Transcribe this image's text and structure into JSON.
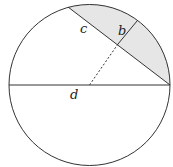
{
  "diagram": {
    "labels": {
      "c": "c",
      "b": "b",
      "d": "d"
    },
    "colors": {
      "stroke": "#333333",
      "shade": "#e6e6e6",
      "background": "#ffffff"
    },
    "circle": {
      "cx": 89.5,
      "cy": 85,
      "r": 80.5
    }
  }
}
